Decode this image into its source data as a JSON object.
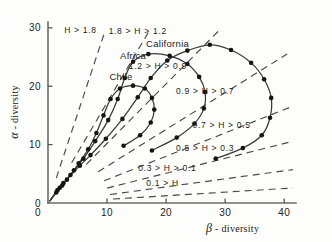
{
  "chart_data": {
    "type": "line",
    "title": "",
    "xlabel": "β - diversity",
    "ylabel": "α - diversity",
    "xlim": [
      0,
      42
    ],
    "ylim": [
      0,
      31
    ],
    "xticks": [
      0,
      10,
      20,
      30,
      40
    ],
    "xtick_labels": [
      "0",
      "10",
      "20",
      "30",
      "40"
    ],
    "yticks": [
      0,
      10,
      20,
      30
    ],
    "ytick_labels": [
      "0",
      "10",
      "20",
      "30"
    ],
    "grid": false,
    "legend_position": "inline-annotations",
    "series": [
      {
        "name": "California",
        "label": "California",
        "label_x": 16.6,
        "label_y": 27.2,
        "points": [
          {
            "x": 0.4,
            "y": 0.5
          },
          {
            "x": 2.0,
            "y": 2.6
          },
          {
            "x": 3.2,
            "y": 4.0
          },
          {
            "x": 5.4,
            "y": 6.4
          },
          {
            "x": 7.2,
            "y": 8.2
          },
          {
            "x": 9.8,
            "y": 11.0
          },
          {
            "x": 12.6,
            "y": 14.4
          },
          {
            "x": 15.2,
            "y": 18.1
          },
          {
            "x": 17.4,
            "y": 21.4
          },
          {
            "x": 20.2,
            "y": 24.4
          },
          {
            "x": 23.6,
            "y": 26.1
          },
          {
            "x": 27.4,
            "y": 27.1
          },
          {
            "x": 31.0,
            "y": 26.2
          },
          {
            "x": 34.4,
            "y": 24.0
          },
          {
            "x": 36.6,
            "y": 21.2
          },
          {
            "x": 37.8,
            "y": 18.0
          },
          {
            "x": 37.6,
            "y": 14.6
          },
          {
            "x": 36.2,
            "y": 11.6
          },
          {
            "x": 33.0,
            "y": 9.4
          },
          {
            "x": 28.4,
            "y": 7.6
          }
        ]
      },
      {
        "name": "Africa",
        "label": "Africa",
        "label_x": 12.2,
        "label_y": 25.1,
        "points": [
          {
            "x": 0.3,
            "y": 0.4
          },
          {
            "x": 1.6,
            "y": 2.2
          },
          {
            "x": 2.6,
            "y": 3.4
          },
          {
            "x": 4.4,
            "y": 5.6
          },
          {
            "x": 6.0,
            "y": 7.6
          },
          {
            "x": 8.0,
            "y": 10.6
          },
          {
            "x": 10.2,
            "y": 14.2
          },
          {
            "x": 11.8,
            "y": 17.8
          },
          {
            "x": 13.0,
            "y": 21.4
          },
          {
            "x": 14.4,
            "y": 24.2
          },
          {
            "x": 17.0,
            "y": 25.5
          },
          {
            "x": 20.6,
            "y": 25.2
          },
          {
            "x": 23.6,
            "y": 23.8
          },
          {
            "x": 25.6,
            "y": 21.6
          },
          {
            "x": 26.6,
            "y": 19.0
          },
          {
            "x": 26.4,
            "y": 16.2
          },
          {
            "x": 24.8,
            "y": 13.6
          },
          {
            "x": 21.8,
            "y": 11.2
          },
          {
            "x": 17.6,
            "y": 9.0
          }
        ]
      },
      {
        "name": "Chile",
        "label": "Chile",
        "label_x": 10.4,
        "label_y": 21.5,
        "points": [
          {
            "x": 0.3,
            "y": 0.3
          },
          {
            "x": 1.4,
            "y": 1.8
          },
          {
            "x": 2.4,
            "y": 3.0
          },
          {
            "x": 3.8,
            "y": 4.8
          },
          {
            "x": 5.2,
            "y": 6.8
          },
          {
            "x": 6.8,
            "y": 9.2
          },
          {
            "x": 8.2,
            "y": 12.0
          },
          {
            "x": 9.4,
            "y": 15.0
          },
          {
            "x": 10.6,
            "y": 17.8
          },
          {
            "x": 12.2,
            "y": 19.6
          },
          {
            "x": 14.4,
            "y": 20.1
          },
          {
            "x": 16.4,
            "y": 19.6
          },
          {
            "x": 17.6,
            "y": 18.0
          },
          {
            "x": 18.0,
            "y": 16.0
          },
          {
            "x": 17.4,
            "y": 13.8
          },
          {
            "x": 15.6,
            "y": 11.6
          },
          {
            "x": 12.8,
            "y": 9.8
          }
        ]
      }
    ],
    "isolines": [
      {
        "name": "H-gt-1.8",
        "label": "H  >  1.8",
        "label_x": 5.5,
        "label_y": 29.6,
        "slope": 3.05,
        "x_start": 1.4,
        "x_end": 9.6
      },
      {
        "name": "1.8-gt-H-gt-1.2",
        "label": "1.8 > H >  1.2",
        "label_x": 15.2,
        "label_y": 29.5,
        "slope": 1.72,
        "x_start": 4.0,
        "x_end": 17.4
      },
      {
        "name": "1.2-gt-H-gt-0.9",
        "label": "1.2 > H > 0.9",
        "label_x": 18.6,
        "label_y": 23.4,
        "slope": 1.02,
        "x_start": 6.5,
        "x_end": 29.0
      },
      {
        "name": "0.9-gt-H-gt-0.7",
        "label": "0.9 > H > 0.7",
        "label_x": 26.6,
        "label_y": 19.2,
        "slope": 0.63,
        "x_start": 8.5,
        "x_end": 40.5
      },
      {
        "name": "0.7-gt-H-gt-0.5",
        "label": "0.7 > H > 0.5",
        "label_x": 29.4,
        "label_y": 13.3,
        "slope": 0.4,
        "x_start": 9.5,
        "x_end": 41.5
      },
      {
        "name": "0.5-gt-H-gt-0.3",
        "label": "0.5 > H > 0.3",
        "label_x": 26.6,
        "label_y": 9.5,
        "slope": 0.255,
        "x_start": 10.0,
        "x_end": 41.5
      },
      {
        "name": "0.3-gt-H-gt-0.1",
        "label": "0.3 > H > 0.1",
        "label_x": 20.2,
        "label_y": 6.0,
        "slope": 0.138,
        "x_start": 10.5,
        "x_end": 41.5
      },
      {
        "name": "0.1-gt-H",
        "label": "0.1 > H",
        "label_x": 19.4,
        "label_y": 3.4,
        "slope": 0.062,
        "x_start": 11.0,
        "x_end": 41.5
      }
    ]
  }
}
